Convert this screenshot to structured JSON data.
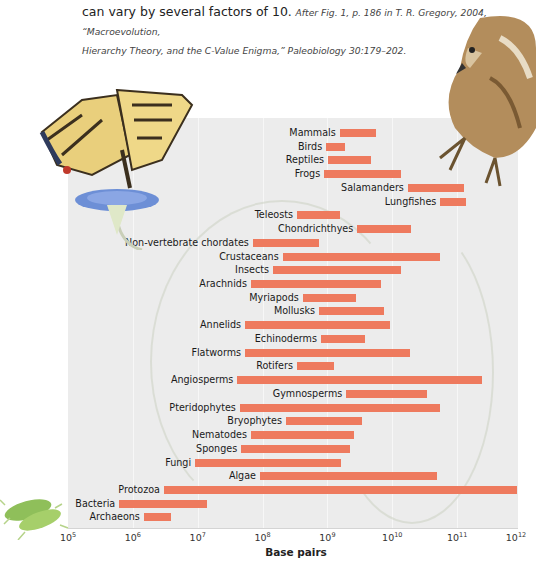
{
  "caption": {
    "lead": "can vary by several factors of 10.",
    "cite_line1": "After Fig. 1, p. 186 in T. R. Gregory, 2004, “Macroevolution,",
    "cite_line2": "Hierarchy Theory, and the C-Value Enigma,” Paleobiology 30:179–202."
  },
  "axis": {
    "xlabel": "Base pairs",
    "ticks": [
      {
        "base": "10",
        "exp": "5"
      },
      {
        "base": "10",
        "exp": "6"
      },
      {
        "base": "10",
        "exp": "7"
      },
      {
        "base": "10",
        "exp": "8"
      },
      {
        "base": "10",
        "exp": "9"
      },
      {
        "base": "10",
        "exp": "10"
      },
      {
        "base": "10",
        "exp": "11"
      },
      {
        "base": "10",
        "exp": "12"
      }
    ]
  },
  "colors": {
    "bar": "#ee7a5e",
    "panel": "#ececec"
  },
  "decorations": [
    "butterfly-on-flower-illustration",
    "hawk-illustration",
    "bacteria-illustration",
    "vine-illustration"
  ],
  "chart_data": {
    "type": "bar",
    "orientation": "horizontal-range",
    "title": "",
    "xlabel": "Base pairs",
    "ylabel": "",
    "xscale": "log10",
    "xlim": [
      100000,
      1000000000000
    ],
    "x_tick_labels": [
      "10^5",
      "10^6",
      "10^7",
      "10^8",
      "10^9",
      "10^10",
      "10^11",
      "10^12"
    ],
    "grid": "vertical at decades",
    "legend": null,
    "units": "log10(base pairs)",
    "categories": [
      "Mammals",
      "Birds",
      "Reptiles",
      "Frogs",
      "Salamanders",
      "Lungfishes",
      "Teleosts",
      "Chondrichthyes",
      "Non-vertebrate chordates",
      "Crustaceans",
      "Insects",
      "Arachnids",
      "Myriapods",
      "Mollusks",
      "Annelids",
      "Echinoderms",
      "Flatworms",
      "Rotifers",
      "Angiosperms",
      "Gymnosperms",
      "Pteridophytes",
      "Bryophytes",
      "Nematodes",
      "Sponges",
      "Fungi",
      "Algae",
      "Protozoa",
      "Bacteria",
      "Archaeons"
    ],
    "series": [
      {
        "name": "min_log10_bp",
        "values": [
          9.19,
          8.98,
          9.01,
          8.95,
          10.24,
          10.74,
          8.53,
          9.46,
          7.85,
          8.31,
          8.16,
          7.82,
          8.62,
          8.87,
          7.73,
          8.9,
          7.73,
          8.53,
          7.61,
          9.29,
          7.65,
          8.36,
          7.82,
          7.67,
          6.96,
          7.96,
          6.48,
          5.79,
          6.17
        ]
      },
      {
        "name": "max_log10_bp",
        "values": [
          9.75,
          9.27,
          9.67,
          10.13,
          11.11,
          11.14,
          9.19,
          10.29,
          8.87,
          10.74,
          10.13,
          9.83,
          9.44,
          9.87,
          9.96,
          9.58,
          10.27,
          9.1,
          11.38,
          10.53,
          10.74,
          9.53,
          9.41,
          9.35,
          9.21,
          10.69,
          11.92,
          7.14,
          6.59
        ]
      }
    ]
  }
}
